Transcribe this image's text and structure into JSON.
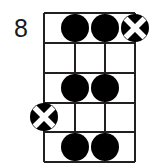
{
  "diagram": {
    "type": "guitar-chord-diagram",
    "fret_position_label": "8",
    "strings": 4,
    "frets": 5,
    "colors": {
      "line": "#231f20",
      "marker_fill": "#000000",
      "marker_x": "#ffffff",
      "background": "#ffffff",
      "text": "#1a1a1a"
    },
    "geometry": {
      "grid_left": 44,
      "grid_right": 135,
      "grid_top": 13,
      "grid_bottom": 162,
      "string_x": [
        44,
        75,
        105,
        135
      ],
      "fret_y": [
        13,
        43,
        73,
        103,
        132,
        162
      ],
      "marker_radius": 14
    },
    "markers": [
      {
        "name": "dot-fret1-string2",
        "kind": "dot",
        "string": 2,
        "fret": 1,
        "cx": 75,
        "cy": 28
      },
      {
        "name": "dot-fret1-string3",
        "kind": "dot",
        "string": 3,
        "fret": 1,
        "cx": 105,
        "cy": 28
      },
      {
        "name": "cross-fret1-string4",
        "kind": "cross",
        "string": 4,
        "fret": 1,
        "cx": 135,
        "cy": 28
      },
      {
        "name": "dot-fret3-string2",
        "kind": "dot",
        "string": 2,
        "fret": 3,
        "cx": 75,
        "cy": 88
      },
      {
        "name": "dot-fret3-string3",
        "kind": "dot",
        "string": 3,
        "fret": 3,
        "cx": 105,
        "cy": 88
      },
      {
        "name": "cross-fret4-string1",
        "kind": "cross",
        "string": 1,
        "fret": 4,
        "cx": 44,
        "cy": 117
      },
      {
        "name": "dot-fret5-string2",
        "kind": "dot",
        "string": 2,
        "fret": 5,
        "cx": 75,
        "cy": 147
      },
      {
        "name": "dot-fret5-string3",
        "kind": "dot",
        "string": 3,
        "fret": 5,
        "cx": 105,
        "cy": 147
      }
    ]
  }
}
